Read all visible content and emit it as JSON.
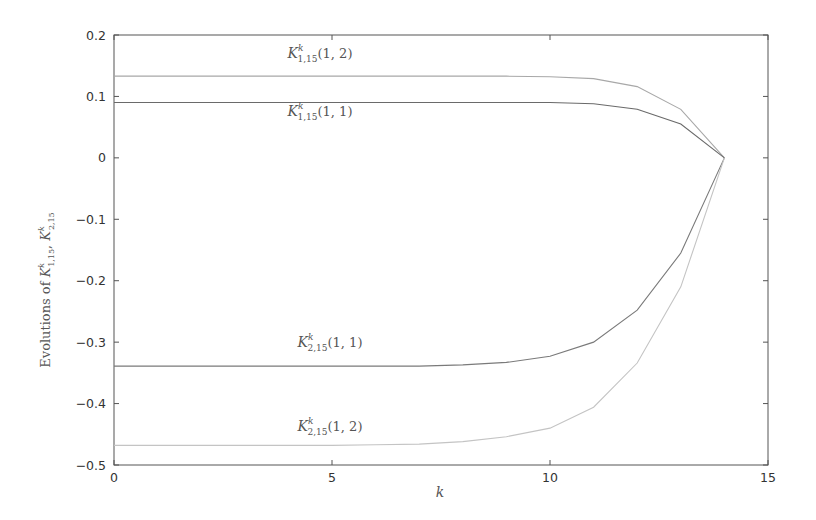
{
  "chart_data": {
    "type": "line",
    "title": "",
    "xlabel": "k",
    "ylabel": "Evolutions of K^k_{1,15}, K^k_{2,15}",
    "ylabel_parts": {
      "prefix": "Evolutions of ",
      "a_base": "K",
      "a_sup": "k",
      "a_sub": "1,15",
      "sep": ", ",
      "b_base": "K",
      "b_sup": "k",
      "b_sub": "2,15"
    },
    "xlim": [
      0,
      15
    ],
    "ylim": [
      -0.5,
      0.2
    ],
    "xticks": [
      0,
      5,
      10,
      15
    ],
    "xtick_labels": [
      "0",
      "5",
      "10",
      "15"
    ],
    "yticks": [
      0.2,
      0.1,
      0,
      -0.1,
      -0.2,
      -0.3,
      -0.4,
      -0.5
    ],
    "ytick_labels": [
      "0.2",
      "0.1",
      "0",
      "-0.1",
      "-0.2",
      "-0.3",
      "-0.4",
      "-0.5"
    ],
    "grid": false,
    "legend": "none (inline annotations)",
    "x": [
      0,
      1,
      2,
      3,
      4,
      5,
      6,
      7,
      8,
      9,
      10,
      11,
      12,
      13,
      14
    ],
    "series": [
      {
        "name": "K^k_{1,15}(1,2)",
        "base": "K",
        "sup": "k",
        "sub": "1,15",
        "arg": "(1, 2)",
        "color": "#a8a8a8",
        "values": [
          0.133,
          0.133,
          0.133,
          0.133,
          0.133,
          0.133,
          0.133,
          0.133,
          0.133,
          0.133,
          0.132,
          0.129,
          0.116,
          0.079,
          0.0
        ],
        "label_pos": [
          320,
          58
        ]
      },
      {
        "name": "K^k_{1,15}(1,1)",
        "base": "K",
        "sup": "k",
        "sub": "1,15",
        "arg": "(1, 1)",
        "color": "#6a6a6a",
        "values": [
          0.09,
          0.09,
          0.09,
          0.09,
          0.09,
          0.09,
          0.09,
          0.09,
          0.09,
          0.09,
          0.09,
          0.088,
          0.079,
          0.055,
          0.0
        ],
        "label_pos": [
          320,
          116
        ]
      },
      {
        "name": "K^k_{2,15}(1,1)",
        "base": "K",
        "sup": "k",
        "sub": "2,15",
        "arg": "(1, 1)",
        "color": "#7a7a7a",
        "values": [
          -0.339,
          -0.339,
          -0.339,
          -0.339,
          -0.339,
          -0.339,
          -0.339,
          -0.339,
          -0.337,
          -0.333,
          -0.323,
          -0.3,
          -0.248,
          -0.155,
          0.0
        ],
        "label_pos": [
          330,
          347
        ]
      },
      {
        "name": "K^k_{2,15}(1,2)",
        "base": "K",
        "sup": "k",
        "sub": "2,15",
        "arg": "(1, 2)",
        "color": "#c4c4c4",
        "values": [
          -0.468,
          -0.468,
          -0.468,
          -0.468,
          -0.468,
          -0.468,
          -0.467,
          -0.466,
          -0.462,
          -0.454,
          -0.44,
          -0.406,
          -0.334,
          -0.21,
          0.0
        ],
        "label_pos": [
          330,
          431
        ]
      }
    ]
  }
}
